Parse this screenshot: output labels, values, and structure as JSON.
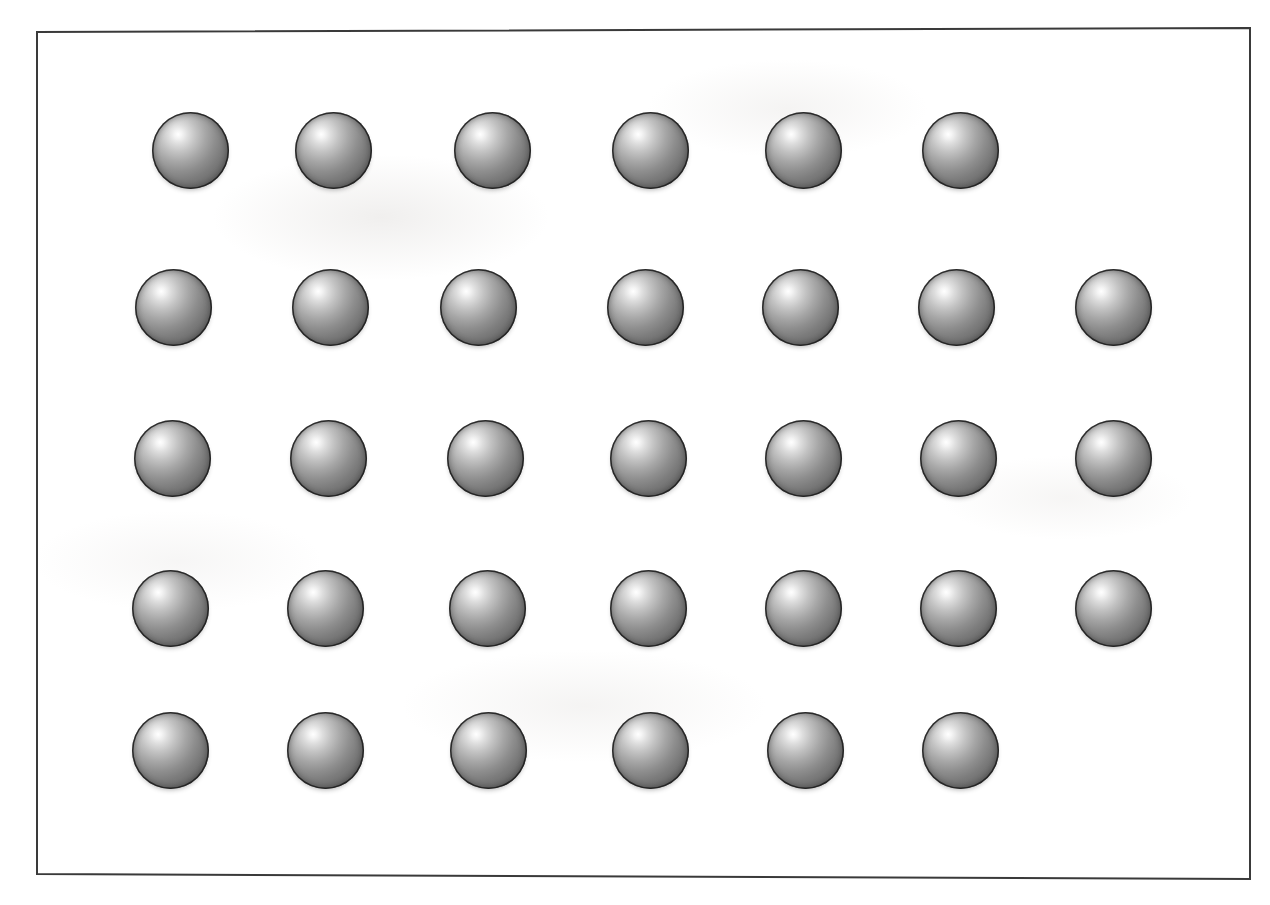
{
  "figure": {
    "kind": "sphere-array-illustration",
    "title": "",
    "caption": "",
    "background_color": "#ffffff",
    "frame": {
      "name": "rectangular-border",
      "stroke_color": "#3a3a3a",
      "stroke_width": 2,
      "corners": {
        "top_left": [
          37,
          32
        ],
        "top_right": [
          1250,
          28
        ],
        "bottom_right": [
          1250,
          879
        ],
        "bottom_left": [
          37,
          874
        ]
      }
    },
    "sphere_style": {
      "name": "shaded-sphere",
      "diameter": 77,
      "highlight_color": "#ffffff",
      "midtone_color": "#8e8e8e",
      "shadow_color": "#555555",
      "edge_color": "#3b3b3b",
      "highlight_position": "34% 29%"
    },
    "counts": {
      "rows": 5,
      "total_spheres": 33,
      "per_row": [
        6,
        7,
        7,
        7,
        6
      ]
    },
    "rows": [
      {
        "index": 1,
        "label": "row-1",
        "count": 6,
        "y": 150,
        "x_centers": [
          190,
          333,
          492,
          650,
          803,
          960
        ]
      },
      {
        "index": 2,
        "label": "row-2",
        "count": 7,
        "y": 307,
        "x_centers": [
          173,
          330,
          478,
          645,
          800,
          956,
          1113
        ]
      },
      {
        "index": 3,
        "label": "row-3",
        "count": 7,
        "y": 458,
        "x_centers": [
          172,
          328,
          485,
          648,
          803,
          958,
          1113
        ]
      },
      {
        "index": 4,
        "label": "row-4",
        "count": 7,
        "y": 608,
        "x_centers": [
          170,
          325,
          487,
          648,
          803,
          958,
          1113
        ]
      },
      {
        "index": 5,
        "label": "row-5",
        "count": 6,
        "y": 750,
        "x_centers": [
          170,
          325,
          488,
          650,
          805,
          960
        ]
      }
    ]
  },
  "chart_data": {
    "type": "scatter",
    "title": "",
    "xlabel": "",
    "ylabel": "",
    "grid": false,
    "legend": null,
    "marker": "filled-shaded-sphere",
    "marker_size_px": 77,
    "xlim": [
      37,
      1250
    ],
    "ylim": [
      32,
      879
    ],
    "categories": [
      "row-1",
      "row-2",
      "row-3",
      "row-4",
      "row-5"
    ],
    "values": [
      6,
      7,
      7,
      7,
      6
    ],
    "series": [
      {
        "name": "row-1",
        "x": [
          190,
          333,
          492,
          650,
          803,
          960
        ],
        "y": [
          150,
          150,
          150,
          150,
          150,
          150
        ]
      },
      {
        "name": "row-2",
        "x": [
          173,
          330,
          478,
          645,
          800,
          956,
          1113
        ],
        "y": [
          307,
          307,
          307,
          307,
          307,
          307,
          307
        ]
      },
      {
        "name": "row-3",
        "x": [
          172,
          328,
          485,
          648,
          803,
          958,
          1113
        ],
        "y": [
          458,
          458,
          458,
          458,
          458,
          458,
          458
        ]
      },
      {
        "name": "row-4",
        "x": [
          170,
          325,
          487,
          648,
          803,
          958,
          1113
        ],
        "y": [
          608,
          608,
          608,
          608,
          608,
          608,
          608
        ]
      },
      {
        "name": "row-5",
        "x": [
          170,
          325,
          488,
          650,
          805,
          960
        ],
        "y": [
          750,
          750,
          750,
          750,
          750,
          750
        ]
      }
    ],
    "annotations": []
  }
}
